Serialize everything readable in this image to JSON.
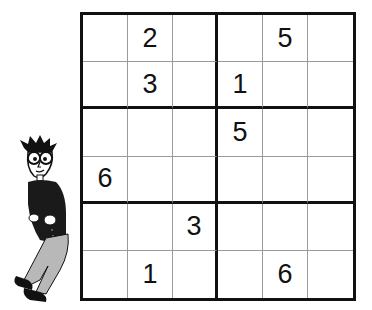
{
  "puzzle": {
    "type": "sudoku-6x6",
    "size": 6,
    "box_rows": 2,
    "box_cols": 3,
    "rows": [
      [
        "",
        "2",
        "",
        "",
        "5",
        ""
      ],
      [
        "",
        "3",
        "",
        "1",
        "",
        ""
      ],
      [
        "",
        "",
        "",
        "5",
        "",
        ""
      ],
      [
        "6",
        "",
        "",
        "",
        "",
        ""
      ],
      [
        "",
        "",
        "3",
        "",
        "",
        ""
      ],
      [
        "",
        "1",
        "",
        "",
        "6",
        ""
      ]
    ]
  },
  "illustration": {
    "subject": "cartoon-man-leaning-on-grid",
    "icon": "dummies-character"
  },
  "colors": {
    "grid_line_thick": "#111111",
    "grid_line_thin": "#9a9a9a",
    "digit": "#111111",
    "pants": "#b8b8b8",
    "shirt": "#1a1a1a"
  }
}
